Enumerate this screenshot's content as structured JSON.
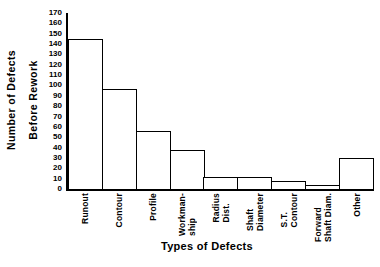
{
  "chart_data": {
    "type": "bar",
    "title": "",
    "xlabel": "Types of Defects",
    "ylabel": "Number of Defects Before Rework",
    "ylabel_lines": [
      "Number of Defects",
      "Before Rework"
    ],
    "categories": [
      "Runout",
      "Contour",
      "Profile",
      "Workman-ship",
      "Radius Dist.",
      "Shaft Diameter",
      "S.T. Contour",
      "Forward Shaft Diam.",
      "Other"
    ],
    "category_lines": [
      [
        "Runout"
      ],
      [
        "Contour"
      ],
      [
        "Profile"
      ],
      [
        "Workman-",
        "ship"
      ],
      [
        "Radius",
        "Dist."
      ],
      [
        "Shaft",
        "Diameter"
      ],
      [
        "S.T.",
        "Contour"
      ],
      [
        "Forward",
        "Shaft Diam."
      ],
      [
        "Other"
      ]
    ],
    "values": [
      145,
      97,
      56,
      38,
      12,
      12,
      8,
      4,
      30
    ],
    "ylim": [
      0,
      170
    ],
    "ytick_values": [
      0,
      10,
      20,
      30,
      40,
      50,
      60,
      70,
      80,
      90,
      100,
      110,
      120,
      130,
      140,
      150,
      160,
      170
    ],
    "ytick_labels": [
      "0",
      "10",
      "20",
      "30",
      "40",
      "50",
      "60",
      "70",
      "80",
      "90",
      "100",
      "110",
      "120",
      "130",
      "140",
      "150",
      "160",
      "170"
    ],
    "grid": false,
    "legend": null,
    "bar_fill_color": "#ffffff",
    "bar_edge_color": "#000000",
    "axis_color": "#000000",
    "background_color": "#ffffff"
  }
}
